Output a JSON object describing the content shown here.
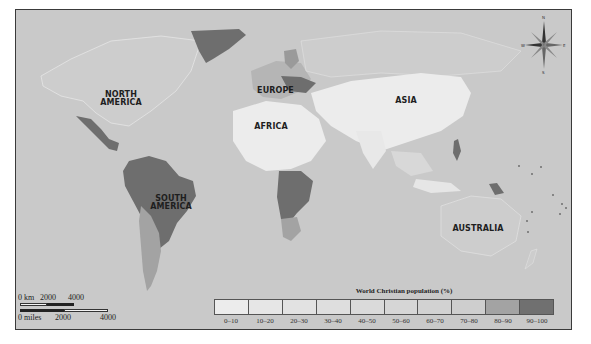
{
  "map": {
    "title": "World Christian population (%)",
    "ocean_color": "#c9c9c9",
    "regions": [
      {
        "label_line1": "NORTH",
        "label_line2": "AMERICA",
        "x": 72,
        "y": 90
      },
      {
        "label_line1": "EUROPE",
        "label_line2": "",
        "x": 255,
        "y": 86
      },
      {
        "label_line1": "AFRICA",
        "label_line2": "",
        "x": 253,
        "y": 123
      },
      {
        "label_line1": "ASIA",
        "label_line2": "",
        "x": 387,
        "y": 96
      },
      {
        "label_line1": "SOUTH",
        "label_line2": "AMERICA",
        "x": 144,
        "y": 194
      },
      {
        "label_line1": "AUSTRALIA",
        "label_line2": "",
        "x": 451,
        "y": 224
      }
    ],
    "compass": {
      "n": "N",
      "e": "E",
      "s": "S",
      "w": "W"
    }
  },
  "scale_bar": {
    "km_label": "0 km",
    "km_2000": "2000",
    "km_4000": "4000",
    "miles_label": "0 miles",
    "miles_2000": "2000",
    "miles_4000": "4000"
  },
  "legend": {
    "title": "World Christian population (%)",
    "bins": [
      {
        "label": "0–10",
        "color": "#ececec"
      },
      {
        "label": "10–20",
        "color": "#e6e6e6"
      },
      {
        "label": "20–30",
        "color": "#e2e2e2"
      },
      {
        "label": "30–40",
        "color": "#dedede"
      },
      {
        "label": "40–50",
        "color": "#dadada"
      },
      {
        "label": "50–60",
        "color": "#d6d6d6"
      },
      {
        "label": "60–70",
        "color": "#d2d2d2"
      },
      {
        "label": "70–80",
        "color": "#cecece"
      },
      {
        "label": "80–90",
        "color": "#a3a3a3"
      },
      {
        "label": "90–100",
        "color": "#707070"
      }
    ]
  }
}
